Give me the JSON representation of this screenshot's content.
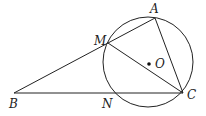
{
  "diagram": {
    "type": "geometry",
    "circle": {
      "center": "O",
      "cx": 148,
      "cy": 62,
      "r": 45
    },
    "points": {
      "A": {
        "label": "A",
        "x": 155,
        "y": 18
      },
      "M": {
        "label": "M",
        "x": 108,
        "y": 43
      },
      "B": {
        "label": "B",
        "x": 14,
        "y": 93
      },
      "N": {
        "label": "N",
        "x": 104,
        "y": 93
      },
      "C": {
        "label": "C",
        "x": 183,
        "y": 93
      },
      "O": {
        "label": "O",
        "x": 149,
        "y": 64
      }
    },
    "segments": [
      [
        "B",
        "A"
      ],
      [
        "B",
        "C"
      ],
      [
        "A",
        "C"
      ],
      [
        "M",
        "C"
      ]
    ],
    "stroke_color": "#222222"
  }
}
